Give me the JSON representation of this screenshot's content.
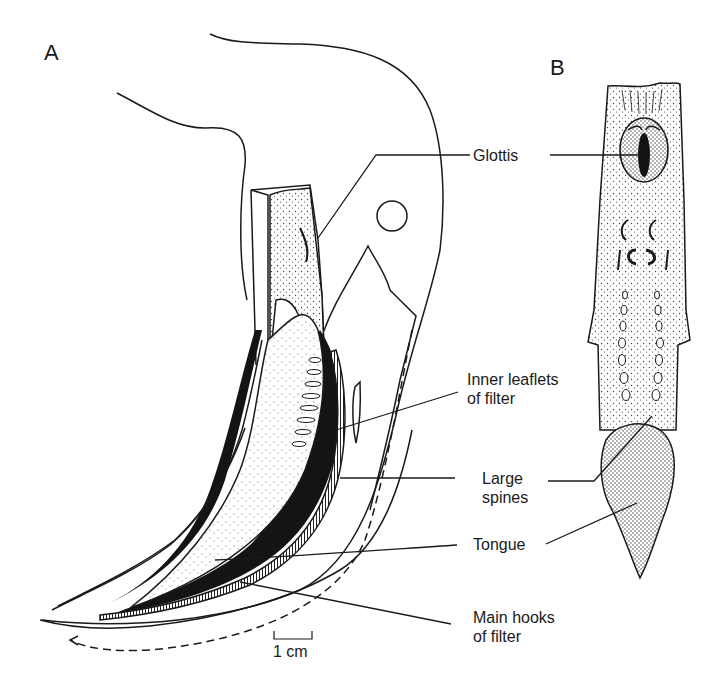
{
  "figure": {
    "panels": [
      {
        "id": "A",
        "letter": "A",
        "description": "Sagittal cut-away view of head/throat showing filter apparatus and tongue"
      },
      {
        "id": "B",
        "letter": "B",
        "description": "Dorsal view of isolated floor of pharynx with glottis and tongue"
      }
    ],
    "labels": {
      "glottis": "Glottis",
      "inner_leaflets": [
        "Inner leaflets",
        "of filter"
      ],
      "large_spines": [
        "Large",
        "spines"
      ],
      "tongue": "Tongue",
      "main_hooks": [
        "Main hooks",
        "of filter"
      ]
    },
    "scale_bar": {
      "label": "1 cm"
    },
    "colors": {
      "ink": "#1a1a1a",
      "background": "#ffffff",
      "stipple": "#555555"
    }
  }
}
